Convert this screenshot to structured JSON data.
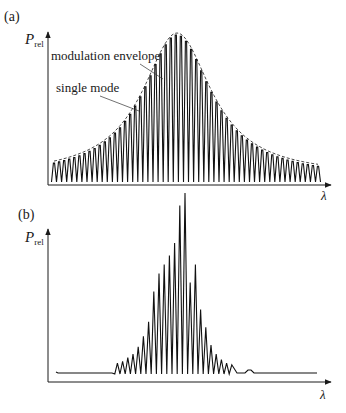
{
  "panels": [
    {
      "label": "(a)",
      "y_axis_label_main": "P",
      "y_axis_label_sub": "rel",
      "x_axis_label": "λ",
      "annotations": [
        {
          "text": "modulation envelope",
          "x": 51,
          "y": 60,
          "line": [
            147,
            66,
            162,
            80
          ]
        },
        {
          "text": "single mode",
          "x": 56,
          "y": 92,
          "line": [
            102,
            97,
            139,
            111
          ]
        }
      ]
    },
    {
      "label": "(b)",
      "y_axis_label_main": "P",
      "y_axis_label_sub": "rel",
      "x_axis_label": "λ"
    }
  ],
  "caption_partial": "",
  "chart_data": [
    {
      "type": "line",
      "title": "(a)",
      "xlabel": "λ",
      "ylabel": "P_rel",
      "description": "Longitudinal mode spectrum: ~53 evenly spaced single-mode peaks under a Lorentzian-like modulation envelope (dashed)",
      "mode_count": 53,
      "center_x_px": 177,
      "envelope": "dashed, peak-normalized 1.0 at center, half-width ~0.25 of span",
      "grid": false,
      "legend": null
    },
    {
      "type": "line",
      "title": "(b)",
      "xlabel": "λ",
      "ylabel": "P_rel",
      "description": "Narrower mode spectrum: sharp peaks concentrated near center with irregular heights, small ripple baseline elsewhere",
      "peak_relative_heights": [
        0.05,
        0.06,
        0.08,
        0.1,
        0.14,
        0.2,
        0.28,
        0.45,
        0.55,
        0.6,
        0.65,
        0.72,
        0.93,
        1.0,
        0.5,
        0.6,
        0.35,
        0.25,
        0.15,
        0.1,
        0.07,
        0.05,
        0.04
      ],
      "grid": false,
      "legend": null
    }
  ]
}
